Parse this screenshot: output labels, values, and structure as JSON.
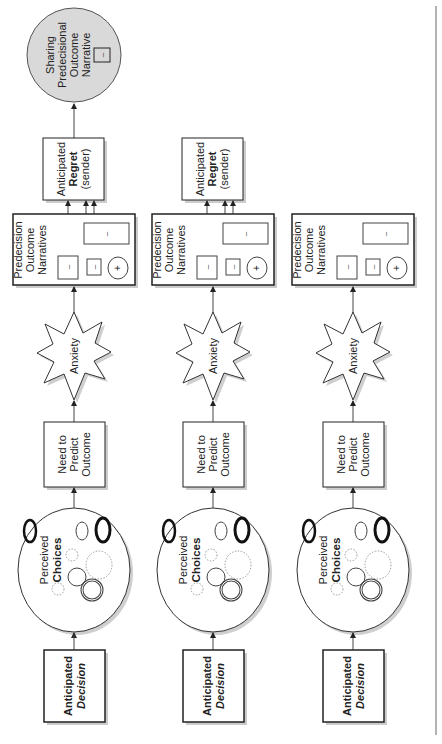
{
  "diagram": {
    "orientation": "rotated-90-ccw",
    "colors": {
      "stroke": "#222222",
      "shadow": "#bdbdbd",
      "sharing_fill": "#d9d9d9",
      "dotted": "#9a9a9a"
    },
    "columns": [
      {
        "decision": {
          "line1": "Anticipated",
          "line2": "Decision"
        },
        "choices": {
          "line1": "Perceived",
          "line2": "Choices"
        },
        "need": {
          "line1": "Need to",
          "line2": "Predict",
          "line3": "Outcome"
        },
        "anxiety": {
          "label": "Anxiety"
        },
        "predecision": {
          "line1": "Predecision",
          "line2": "Outcome",
          "line3": "Narratives",
          "signs": [
            "–",
            "–",
            "+",
            "–"
          ]
        },
        "regret": {
          "line1": "Anticipated",
          "line2": "Regret",
          "line3": "(sender)"
        },
        "sharing": {
          "line1": "Sharing",
          "line2": "Predecisional",
          "line3": "Outcome",
          "line4": "Narrative",
          "sign": "–"
        }
      },
      {
        "decision": {
          "line1": "Anticipated",
          "line2": "Decision"
        },
        "choices": {
          "line1": "Perceived",
          "line2": "Choices"
        },
        "need": {
          "line1": "Need to",
          "line2": "Predict",
          "line3": "Outcome"
        },
        "anxiety": {
          "label": "Anxiety"
        },
        "predecision": {
          "line1": "Predecision",
          "line2": "Outcome",
          "line3": "Narratives",
          "signs": [
            "–",
            "–",
            "+",
            "–"
          ]
        },
        "regret": {
          "line1": "Anticipated",
          "line2": "Regret",
          "line3": "(sender)"
        }
      },
      {
        "decision": {
          "line1": "Anticipated",
          "line2": "Decision"
        },
        "choices": {
          "line1": "Perceived",
          "line2": "Choices"
        },
        "need": {
          "line1": "Need to",
          "line2": "Predict",
          "line3": "Outcome"
        },
        "anxiety": {
          "label": "Anxiety"
        },
        "predecision": {
          "line1": "Predecision",
          "line2": "Outcome",
          "line3": "Narratives",
          "signs": [
            "–",
            "–",
            "+",
            "–"
          ]
        }
      }
    ]
  }
}
